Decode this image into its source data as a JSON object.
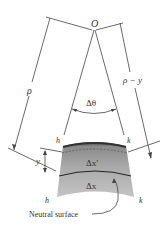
{
  "diagram": {
    "labels": {
      "origin": "O",
      "rho": "ρ",
      "rho_minus_y": "ρ − y",
      "delta_theta": "Δθ",
      "h_top": "h",
      "k_top": "k",
      "h_bottom": "h",
      "k_bottom": "k",
      "y": "y",
      "delta_x_prime": "Δx′",
      "delta_x": "Δx",
      "neutral_surface": "Neutral surface"
    },
    "colors": {
      "line": "#444444",
      "block_top": "#5a5a5a",
      "block_mid": "#a8a8a8",
      "block_bottom": "#bdbdbd",
      "text": "#333333"
    }
  }
}
